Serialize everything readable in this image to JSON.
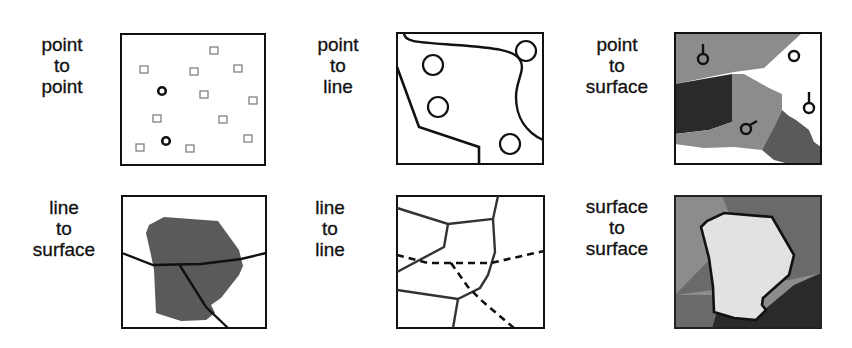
{
  "colors": {
    "stroke": "#111111",
    "background": "#ffffff",
    "mid_gray": "#8c8c8c",
    "dark_gray": "#5a5a5a",
    "very_dark": "#2a2a2a",
    "light_fill": "#e2e2e2"
  },
  "panels": [
    {
      "id": "point-to-point",
      "label_lines": [
        "point",
        "to",
        "point"
      ]
    },
    {
      "id": "point-to-line",
      "label_lines": [
        "point",
        "to",
        "line"
      ]
    },
    {
      "id": "point-to-surface",
      "label_lines": [
        "point",
        "to",
        "surface"
      ]
    },
    {
      "id": "line-to-surface",
      "label_lines": [
        "line",
        "to",
        "surface"
      ]
    },
    {
      "id": "line-to-line",
      "label_lines": [
        "line",
        "to",
        "line"
      ]
    },
    {
      "id": "surface-to-surface",
      "label_lines": [
        "surface",
        "to",
        "surface"
      ]
    }
  ]
}
